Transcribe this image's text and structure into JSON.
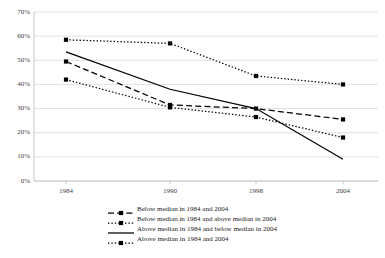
{
  "chart_data": {
    "type": "line",
    "title": "",
    "subtitle": "",
    "xlabel": "",
    "ylabel": "",
    "x": [
      "1984",
      "1990",
      "1998",
      "2004"
    ],
    "categories": [
      "1984",
      "1990",
      "1998",
      "2004"
    ],
    "xtick_labels": [
      "1984",
      "1990",
      "1998",
      "2004"
    ],
    "ytick_labels": [
      "0%",
      "10%",
      "20%",
      "30%",
      "40%",
      "50%",
      "60%",
      "70%"
    ],
    "ytick_values": [
      0,
      10,
      20,
      30,
      40,
      50,
      60,
      70
    ],
    "ylim": [
      0,
      70
    ],
    "grid": "horizontal",
    "legend_position": "bottom",
    "units": "percent",
    "series": [
      {
        "name": "Below median in 1984 and 2004",
        "values": [
          49.5,
          31.5,
          30.0,
          25.5
        ],
        "line_style": "dashed",
        "marker": "square",
        "color": "#000000"
      },
      {
        "name": "Below median in 1984 and above median in 2004",
        "values": [
          42.0,
          30.5,
          26.5,
          18.0
        ],
        "line_style": "dotted",
        "marker": "square",
        "color": "#000000"
      },
      {
        "name": "Above median in 1984 and below median in 2004",
        "values": [
          53.5,
          38.0,
          30.0,
          9.0
        ],
        "line_style": "solid",
        "marker": "none",
        "color": "#000000"
      },
      {
        "name": "Above median in 1984 and 2004",
        "values": [
          58.5,
          57.0,
          43.5,
          40.0
        ],
        "line_style": "dotted",
        "marker": "square",
        "color": "#000000"
      }
    ]
  },
  "legend": {
    "items": [
      {
        "label": "Below median in 1984 and 2004"
      },
      {
        "label": "Below median in 1984 and above median in 2004"
      },
      {
        "label": "Above median in 1984 and below median in 2004"
      },
      {
        "label": "Above median in 1984 and 2004"
      }
    ]
  },
  "colors": {
    "line": "#000000",
    "grid": "#d9d9d9",
    "axis": "#bfbfbf",
    "tick_text": "#404040"
  }
}
